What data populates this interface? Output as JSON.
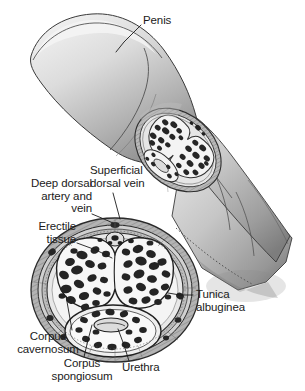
{
  "figure": {
    "background_color": "#ffffff",
    "width": 305,
    "height": 391
  },
  "palette": {
    "ink": "#1b1b1b",
    "shaft_light": "#e3e3e3",
    "shaft_mid": "#c4c4c4",
    "shaft_dark": "#8f8f8f",
    "shaft_shadow": "#6e6e6e",
    "tunica_outer": "#9a9a9a",
    "tunica_inner": "#d7d7d7",
    "cavity_fill": "#f2f2f2",
    "erectile_dark": "#2a2a2a",
    "skin_outline": "#3a3a3a"
  },
  "labels": [
    {
      "id": "penis",
      "text": "Penis",
      "align": "left",
      "x": 143,
      "y": 16,
      "leader": [
        [
          141,
          25
        ],
        [
          124,
          42
        ],
        [
          116,
          52
        ]
      ]
    },
    {
      "id": "superficial-dorsal-vein",
      "lines": [
        "Superficial",
        "dorsal vein"
      ],
      "text": "Superficial\ndorsal vein",
      "align": "left",
      "x": 90,
      "y": 165,
      "leader": [
        [
          113,
          193
        ],
        [
          117,
          208
        ],
        [
          120,
          219
        ]
      ]
    },
    {
      "id": "deep-dorsal-artery-and-vein",
      "lines": [
        "Deep dorsal",
        "artery and",
        "vein"
      ],
      "text": "Deep dorsal\nartery and\nvein",
      "align": "right",
      "x": 17,
      "y": 178,
      "leader": [
        [
          92,
          214
        ],
        [
          104,
          219
        ],
        [
          113,
          223
        ]
      ]
    },
    {
      "id": "erectile-tissue",
      "lines": [
        "Erectile",
        "tissue"
      ],
      "text": "Erectile\ntissue",
      "align": "right",
      "x": 13,
      "y": 221,
      "leader": [
        [
          77,
          243
        ],
        [
          96,
          250
        ],
        [
          112,
          258
        ]
      ]
    },
    {
      "id": "tunica-albuginea",
      "lines": [
        "Tunica",
        "albuginea"
      ],
      "text": "Tunica\nalbuginea",
      "align": "left",
      "x": 195,
      "y": 289,
      "leader": [
        [
          193,
          295
        ],
        [
          180,
          295
        ],
        [
          168,
          293
        ]
      ]
    },
    {
      "id": "corpus-cavernosum",
      "lines": [
        "Corpus",
        "cavernosum"
      ],
      "text": "Corpus\ncavernosum",
      "align": "center",
      "x": 10,
      "y": 331,
      "leader": [
        [
          72,
          330
        ],
        [
          69,
          313
        ],
        [
          66,
          296
        ]
      ]
    },
    {
      "id": "corpus-spongiosum",
      "lines": [
        "Corpus",
        "spongiosum"
      ],
      "text": "Corpus\nspongiosum",
      "align": "center",
      "x": 40,
      "y": 358,
      "leader": [
        [
          84,
          357
        ],
        [
          88,
          340
        ],
        [
          92,
          325
        ]
      ]
    },
    {
      "id": "urethra",
      "text": "Urethra",
      "align": "left",
      "x": 122,
      "y": 362,
      "leader": [
        [
          129,
          361
        ],
        [
          124,
          345
        ],
        [
          118,
          329
        ]
      ]
    }
  ],
  "structures": {
    "shaft": "penile shaft drawn in perspective, glans at upper-left, cut surface at middle-right",
    "inset_cross_section": "cut face within shaft showing paired corpora cavernosa and corpus spongiosum",
    "main_cross_section": "large transverse section at lower-left with two corpora cavernosa above, corpus spongiosum and urethra below, enclosed by tunica albuginea"
  }
}
